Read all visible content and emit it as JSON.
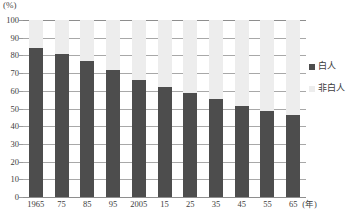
{
  "chart_data": {
    "type": "bar",
    "stacked": true,
    "title": "",
    "subtitle": "",
    "xlabel": "年",
    "ylabel": "",
    "unit_label": "(%)",
    "categories": [
      "1965",
      "75",
      "85",
      "95",
      "2005",
      "15",
      "25",
      "35",
      "45",
      "55",
      "65"
    ],
    "series": [
      {
        "name": "白人",
        "color": "#4d4d4d",
        "values": [
          84,
          81,
          77,
          72,
          66,
          62,
          58.5,
          55.5,
          51.5,
          48.5,
          46.5
        ]
      },
      {
        "name": "非白人",
        "color": "#ededed",
        "values": [
          16,
          19,
          23,
          28,
          34,
          38,
          41.5,
          44.5,
          48.5,
          51.5,
          53.5
        ]
      }
    ],
    "ylim": [
      0,
      100
    ],
    "ytick_values": [
      0,
      10,
      20,
      30,
      40,
      50,
      60,
      70,
      80,
      90,
      100
    ],
    "ytick_labels": [
      "0",
      "10",
      "20",
      "30",
      "40",
      "50",
      "60",
      "70",
      "80",
      "90",
      "100"
    ],
    "grid": true,
    "legend_position": "right"
  },
  "legend": {
    "entries": [
      {
        "label": "白人",
        "color": "#4d4d4d",
        "swatch": "dark"
      },
      {
        "label": "非白人",
        "color": "#ededed",
        "swatch": "light"
      }
    ]
  },
  "axis": {
    "unit": "(%)",
    "x_unit_suffix": "(年)"
  }
}
